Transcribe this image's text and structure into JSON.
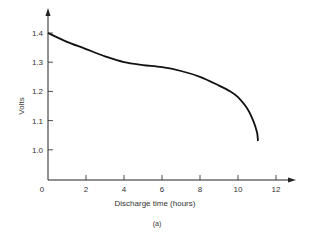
{
  "chart_data": {
    "type": "line",
    "title": "",
    "caption": "(a)",
    "xlabel": "Discharge time (hours)",
    "ylabel": "Volts",
    "xlim": [
      0,
      12.5
    ],
    "ylim": [
      0.9,
      1.45
    ],
    "x_ticks": [
      "0",
      "2",
      "4",
      "6",
      "8",
      "10",
      "12"
    ],
    "y_ticks": [
      "1.0",
      "1.1",
      "1.2",
      "1.3",
      "1.4"
    ],
    "grid": false,
    "legend": null,
    "series": [
      {
        "name": "Discharge curve",
        "x": [
          0,
          1,
          2,
          3,
          4,
          5,
          6,
          7,
          8,
          9,
          9.6,
          10,
          10.5,
          10.8,
          11,
          11.05
        ],
        "y": [
          1.4,
          1.37,
          1.345,
          1.32,
          1.3,
          1.29,
          1.283,
          1.27,
          1.25,
          1.22,
          1.2,
          1.18,
          1.14,
          1.1,
          1.06,
          1.03
        ]
      }
    ]
  }
}
